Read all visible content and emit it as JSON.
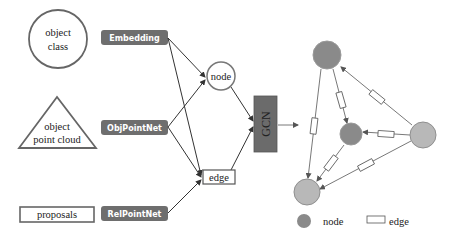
{
  "inputs": {
    "object_class": {
      "line1": "object",
      "line2": "class"
    },
    "object_point_cloud": {
      "line1": "object",
      "line2": "point cloud"
    },
    "proposals": "proposals"
  },
  "modules": {
    "embedding": "Embedding",
    "objpointnet": "ObjPointNet",
    "relpointnet": "RelPointNet",
    "gcn": "GCN"
  },
  "features": {
    "node": "node",
    "edge": "edge"
  },
  "legend": {
    "node": "node",
    "edge": "edge"
  },
  "colors": {
    "module_fill": "#6e6e6e",
    "gcn_fill": "#6b6b6b",
    "node_dark": "#8a8a8a",
    "node_light": "#b8b8b8",
    "node_border": "#8f8f8f",
    "line": "#333333"
  }
}
